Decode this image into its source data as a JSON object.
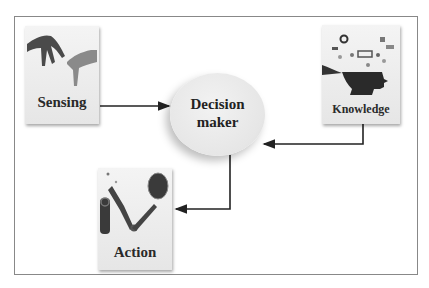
{
  "diagram": {
    "nodes": [
      {
        "id": "sensing",
        "label": "Sensing",
        "icon": "hands-touching-icon"
      },
      {
        "id": "decision",
        "label_line1": "Decision",
        "label_line2": "maker"
      },
      {
        "id": "knowledge",
        "label": "Knowledge",
        "icon": "head-with-data-icons"
      },
      {
        "id": "action",
        "label": "Action",
        "icon": "robotic-arm-icon"
      }
    ],
    "edges": [
      {
        "from": "Sensing",
        "to": "Decision maker"
      },
      {
        "from": "Knowledge",
        "to": "Decision maker"
      },
      {
        "from": "Decision maker",
        "to": "Action"
      }
    ],
    "colors": {
      "line": "#222222",
      "card": "#eeeeee",
      "frame": "#888888"
    }
  }
}
